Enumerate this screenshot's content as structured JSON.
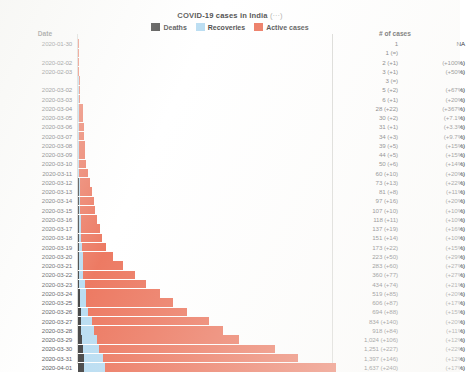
{
  "header": {
    "title": "COVID-19 cases in India",
    "title_suffix": "(···)",
    "legend": [
      {
        "label": "Deaths",
        "color": "#1a1a1a",
        "key": "deaths"
      },
      {
        "label": "Recoveries",
        "color": "#a9d5ef",
        "key": "recoveries"
      },
      {
        "label": "Active cases",
        "color": "#e8593c",
        "key": "active"
      }
    ]
  },
  "columns": {
    "date_header": "Date",
    "cases_header": "# of cases"
  },
  "footer_caption": "",
  "colors": {
    "deaths": "#1a1a1a",
    "recoveries": "#a9d5ef",
    "active": "#e8593c",
    "rule": "#cfcfcb",
    "text": "#35353a"
  },
  "chart_data": {
    "type": "bar",
    "orientation": "horizontal",
    "stacked": true,
    "title": "COVID-19 cases in India",
    "xlabel": "# of cases",
    "ylabel": "Date",
    "grid": false,
    "legend_position": "top",
    "xlim": [
      0,
      1637
    ],
    "series": [
      {
        "name": "Deaths",
        "color": "#1a1a1a"
      },
      {
        "name": "Recoveries",
        "color": "#a9d5ef"
      },
      {
        "name": "Active cases",
        "color": "#e8593c"
      }
    ],
    "categories": [
      "2020-01-30",
      "2020-01-31",
      "2020-02-02",
      "2020-02-03",
      "2020-02-04",
      "2020-03-02",
      "2020-03-03",
      "2020-03-04",
      "2020-03-05",
      "2020-03-06",
      "2020-03-07",
      "2020-03-08",
      "2020-03-09",
      "2020-03-10",
      "2020-03-11",
      "2020-03-12",
      "2020-03-13",
      "2020-03-14",
      "2020-03-15",
      "2020-03-16",
      "2020-03-17",
      "2020-03-18",
      "2020-03-19",
      "2020-03-20",
      "2020-03-21",
      "2020-03-22",
      "2020-03-23",
      "2020-03-24",
      "2020-03-25",
      "2020-03-26",
      "2020-03-27",
      "2020-03-28",
      "2020-03-29",
      "2020-03-30",
      "2020-03-31",
      "2020-04-01"
    ],
    "values": [
      1,
      1,
      2,
      3,
      3,
      5,
      6,
      28,
      30,
      31,
      34,
      39,
      44,
      50,
      60,
      73,
      81,
      97,
      107,
      118,
      137,
      151,
      173,
      223,
      283,
      360,
      434,
      519,
      606,
      694,
      834,
      918,
      1024,
      1251,
      1397,
      1637
    ]
  },
  "rows": [
    {
      "date": "2020-01-30",
      "show_date": true,
      "total": 1,
      "deaths": 0,
      "recoveries": 0,
      "cases": "1",
      "pct": "NA"
    },
    {
      "date": "2020-01-31",
      "show_date": false,
      "total": 1,
      "deaths": 0,
      "recoveries": 0,
      "cases": "1 (=)",
      "pct": ""
    },
    {
      "date": "2020-02-02",
      "show_date": true,
      "total": 2,
      "deaths": 0,
      "recoveries": 0,
      "cases": "2 (+1)",
      "pct": "(+100%)"
    },
    {
      "date": "2020-02-03",
      "show_date": true,
      "total": 3,
      "deaths": 0,
      "recoveries": 0,
      "cases": "3 (+1)",
      "pct": "(+50%)"
    },
    {
      "date": "2020-02-04",
      "show_date": false,
      "total": 3,
      "deaths": 0,
      "recoveries": 1,
      "cases": "3 (=)",
      "pct": ""
    },
    {
      "date": "2020-03-02",
      "show_date": true,
      "total": 5,
      "deaths": 0,
      "recoveries": 1,
      "cases": "5 (+2)",
      "pct": "(+67%)"
    },
    {
      "date": "2020-03-03",
      "show_date": true,
      "total": 6,
      "deaths": 0,
      "recoveries": 1,
      "cases": "6 (+1)",
      "pct": "(+20%)"
    },
    {
      "date": "2020-03-04",
      "show_date": true,
      "total": 28,
      "deaths": 0,
      "recoveries": 1,
      "cases": "28 (+22)",
      "pct": "(+367%)"
    },
    {
      "date": "2020-03-05",
      "show_date": true,
      "total": 30,
      "deaths": 0,
      "recoveries": 1,
      "cases": "30 (+2)",
      "pct": "(+7.1%)"
    },
    {
      "date": "2020-03-06",
      "show_date": true,
      "total": 31,
      "deaths": 0,
      "recoveries": 1,
      "cases": "31 (+1)",
      "pct": "(+3.3%)"
    },
    {
      "date": "2020-03-07",
      "show_date": true,
      "total": 34,
      "deaths": 0,
      "recoveries": 3,
      "cases": "34 (+3)",
      "pct": "(+9.7%)"
    },
    {
      "date": "2020-03-08",
      "show_date": true,
      "total": 39,
      "deaths": 0,
      "recoveries": 3,
      "cases": "39 (+5)",
      "pct": "(+15%)"
    },
    {
      "date": "2020-03-09",
      "show_date": true,
      "total": 44,
      "deaths": 0,
      "recoveries": 3,
      "cases": "44 (+5)",
      "pct": "(+15%)"
    },
    {
      "date": "2020-03-10",
      "show_date": true,
      "total": 50,
      "deaths": 0,
      "recoveries": 4,
      "cases": "50 (+6)",
      "pct": "(+14%)"
    },
    {
      "date": "2020-03-11",
      "show_date": true,
      "total": 60,
      "deaths": 0,
      "recoveries": 4,
      "cases": "60 (+10)",
      "pct": "(+20%)"
    },
    {
      "date": "2020-03-12",
      "show_date": true,
      "total": 73,
      "deaths": 1,
      "recoveries": 4,
      "cases": "73 (+13)",
      "pct": "(+22%)"
    },
    {
      "date": "2020-03-13",
      "show_date": true,
      "total": 81,
      "deaths": 1,
      "recoveries": 4,
      "cases": "81 (+8)",
      "pct": "(+11%)"
    },
    {
      "date": "2020-03-14",
      "show_date": true,
      "total": 97,
      "deaths": 2,
      "recoveries": 10,
      "cases": "97 (+16)",
      "pct": "(+20%)"
    },
    {
      "date": "2020-03-15",
      "show_date": true,
      "total": 107,
      "deaths": 2,
      "recoveries": 10,
      "cases": "107 (+10)",
      "pct": "(+10%)"
    },
    {
      "date": "2020-03-16",
      "show_date": true,
      "total": 118,
      "deaths": 2,
      "recoveries": 13,
      "cases": "118 (+11)",
      "pct": "(+10%)"
    },
    {
      "date": "2020-03-17",
      "show_date": true,
      "total": 137,
      "deaths": 3,
      "recoveries": 14,
      "cases": "137 (+19)",
      "pct": "(+16%)"
    },
    {
      "date": "2020-03-18",
      "show_date": true,
      "total": 151,
      "deaths": 3,
      "recoveries": 14,
      "cases": "151 (+14)",
      "pct": "(+10%)"
    },
    {
      "date": "2020-03-19",
      "show_date": true,
      "total": 173,
      "deaths": 4,
      "recoveries": 20,
      "cases": "173 (+22)",
      "pct": "(+15%)"
    },
    {
      "date": "2020-03-20",
      "show_date": true,
      "total": 223,
      "deaths": 4,
      "recoveries": 23,
      "cases": "223 (+50)",
      "pct": "(+29%)"
    },
    {
      "date": "2020-03-21",
      "show_date": true,
      "total": 283,
      "deaths": 5,
      "recoveries": 23,
      "cases": "283 (+60)",
      "pct": "(+27%)"
    },
    {
      "date": "2020-03-22",
      "show_date": true,
      "total": 360,
      "deaths": 7,
      "recoveries": 24,
      "cases": "360 (+77)",
      "pct": "(+27%)"
    },
    {
      "date": "2020-03-23",
      "show_date": true,
      "total": 434,
      "deaths": 9,
      "recoveries": 35,
      "cases": "434 (+74)",
      "pct": "(+21%)"
    },
    {
      "date": "2020-03-24",
      "show_date": true,
      "total": 519,
      "deaths": 10,
      "recoveries": 40,
      "cases": "519 (+85)",
      "pct": "(+20%)"
    },
    {
      "date": "2020-03-25",
      "show_date": true,
      "total": 606,
      "deaths": 11,
      "recoveries": 43,
      "cases": "606 (+87)",
      "pct": "(+17%)"
    },
    {
      "date": "2020-03-26",
      "show_date": true,
      "total": 694,
      "deaths": 16,
      "recoveries": 47,
      "cases": "694 (+88)",
      "pct": "(+15%)"
    },
    {
      "date": "2020-03-27",
      "show_date": true,
      "total": 834,
      "deaths": 19,
      "recoveries": 67,
      "cases": "834 (+140)",
      "pct": "(+20%)"
    },
    {
      "date": "2020-03-28",
      "show_date": true,
      "total": 918,
      "deaths": 21,
      "recoveries": 79,
      "cases": "918 (+84)",
      "pct": "(+11%)"
    },
    {
      "date": "2020-03-29",
      "show_date": true,
      "total": 1024,
      "deaths": 25,
      "recoveries": 95,
      "cases": "1,024 (+106)",
      "pct": "(+12%)"
    },
    {
      "date": "2020-03-30",
      "show_date": true,
      "total": 1251,
      "deaths": 32,
      "recoveries": 102,
      "cases": "1,251 (+227)",
      "pct": "(+22%)"
    },
    {
      "date": "2020-03-31",
      "show_date": true,
      "total": 1397,
      "deaths": 35,
      "recoveries": 123,
      "cases": "1,397 (+146)",
      "pct": "(+12%)"
    },
    {
      "date": "2020-04-01",
      "show_date": true,
      "total": 1637,
      "deaths": 38,
      "recoveries": 132,
      "cases": "1,637 (+240)",
      "pct": "(+17%)"
    }
  ]
}
